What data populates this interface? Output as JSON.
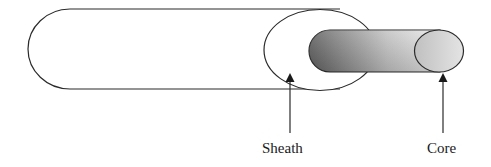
{
  "diagram": {
    "labels": {
      "sheath": "Sheath",
      "core": "Core"
    },
    "colors": {
      "stroke": "#2a2a2a",
      "core_dark": "#6e6e6e",
      "core_light": "#e8e8e8"
    }
  }
}
